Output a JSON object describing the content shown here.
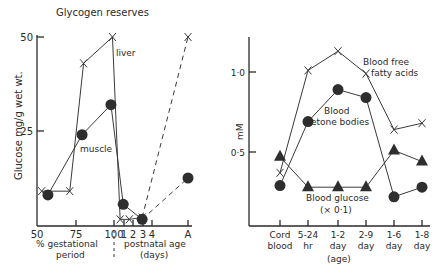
{
  "chart_data": [
    {
      "type": "line",
      "title": "Glycogen reserves",
      "ylabel": "Glucose mg/g wet wt.",
      "ylim": [
        0,
        50
      ],
      "yticks": [
        {
          "value": 25,
          "label": "25"
        },
        {
          "value": 50,
          "label": "50"
        }
      ],
      "xaxis_segments": [
        {
          "label": "% gestational period",
          "ticks": [
            "50",
            "75",
            "100"
          ]
        },
        {
          "label": "postnatal age (days)",
          "ticks": [
            "1",
            "2",
            "3",
            "4",
            "A"
          ]
        }
      ],
      "xticks": [
        {
          "pos": 50,
          "label": "50"
        },
        {
          "pos": 75,
          "label": "75"
        },
        {
          "pos": 100,
          "label": "100"
        },
        {
          "pos": 106.5,
          "label": "1"
        },
        {
          "pos": 112.5,
          "label": "2"
        },
        {
          "pos": 118.5,
          "label": "3"
        },
        {
          "pos": 124.5,
          "label": "4"
        },
        {
          "pos": 148,
          "label": "A"
        }
      ],
      "xlabel_left": "% gestational period",
      "xlabel_left_line1": "% gestational",
      "xlabel_left_line2": "period",
      "xlabel_right_line1": "postnatal age",
      "xlabel_right_line2": "(days)",
      "series": [
        {
          "name": "liver",
          "marker": "x",
          "points": [
            {
              "x": 53,
              "y": 9
            },
            {
              "x": 71,
              "y": 9
            },
            {
              "x": 80,
              "y": 43
            },
            {
              "x": 99,
              "y": 50
            },
            {
              "x": 104,
              "y": 1.5
            },
            {
              "x": 110,
              "y": 1.5
            },
            {
              "x": 118,
              "y": 2
            }
          ],
          "dashed_points": [
            {
              "x": 118,
              "y": 2
            },
            {
              "x": 148,
              "y": 50
            }
          ]
        },
        {
          "name": "muscle",
          "marker": "dot",
          "points": [
            {
              "x": 57,
              "y": 8
            },
            {
              "x": 79,
              "y": 24
            },
            {
              "x": 98,
              "y": 32
            },
            {
              "x": 106,
              "y": 5.5
            },
            {
              "x": 118,
              "y": 1.5
            }
          ],
          "dashed_points": [
            {
              "x": 118,
              "y": 1.5
            },
            {
              "x": 148,
              "y": 12.5
            }
          ]
        }
      ],
      "annotations": [
        "liver",
        "muscle"
      ]
    },
    {
      "type": "line",
      "title": "",
      "ylabel": "mM",
      "ylim": [
        0,
        1.2
      ],
      "yticks": [
        {
          "value": 0.5,
          "label": "0·5"
        },
        {
          "value": 1.0,
          "label": "1·0"
        }
      ],
      "categories": [
        "Cord blood",
        "5-24 hr",
        "1-2 day",
        "2-9 day",
        "1-6 day",
        "1-8 day"
      ],
      "category_lines": [
        [
          "Cord",
          "blood"
        ],
        [
          "5-24",
          "hr"
        ],
        [
          "1-2",
          "day"
        ],
        [
          "2-9",
          "day"
        ],
        [
          "1-6",
          "day"
        ],
        [
          "1-8",
          "day"
        ]
      ],
      "xlabel": "(age)",
      "series": [
        {
          "name": "Blood free fatty acids",
          "marker": "x",
          "values": [
            0.37,
            1.01,
            1.13,
            0.99,
            0.64,
            0.68
          ]
        },
        {
          "name": "Blood ketone bodies",
          "marker": "dot",
          "values": [
            0.29,
            0.69,
            0.89,
            0.84,
            0.22,
            0.28
          ]
        },
        {
          "name": "Blood glucose (× 0·1)",
          "marker": "triangle",
          "values": [
            0.47,
            0.28,
            0.28,
            0.28,
            0.51,
            0.44
          ]
        }
      ],
      "annotations": {
        "ffa_line1": "Blood free",
        "ffa_line2": "fatty acids",
        "ket_line1": "Blood",
        "ket_line2": "ketone bodies",
        "glu_line1": "Blood glucose",
        "glu_line2": "(× 0·1)"
      }
    }
  ]
}
